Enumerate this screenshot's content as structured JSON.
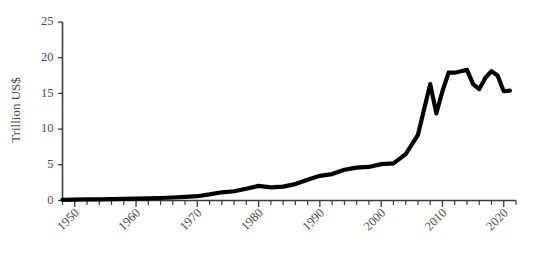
{
  "chart_data": {
    "type": "line",
    "title": "",
    "xlabel": "",
    "ylabel": "Trillion US$",
    "xlim": [
      1948,
      2022
    ],
    "ylim": [
      0,
      25
    ],
    "grid": false,
    "legend": null,
    "y_ticks": [
      0,
      5,
      10,
      15,
      20,
      25
    ],
    "y_tick_labels": [
      "0",
      "5",
      "10",
      "15",
      "20",
      "25"
    ],
    "x_ticks": [
      1950,
      1960,
      1970,
      1980,
      1990,
      2000,
      2010,
      2020
    ],
    "x_tick_labels": [
      "1950",
      "1960",
      "1970",
      "1980",
      "1990",
      "2000",
      "2010",
      "2020"
    ],
    "x_minor_tick_step": 2,
    "x_tick_label_rotation": 45,
    "series_color": "#000000",
    "axis_color": "#3b3b3b",
    "series": [
      {
        "name": "Value",
        "x": [
          1948,
          1950,
          1952,
          1954,
          1956,
          1958,
          1960,
          1962,
          1964,
          1966,
          1968,
          1970,
          1972,
          1974,
          1976,
          1978,
          1980,
          1982,
          1984,
          1986,
          1988,
          1990,
          1992,
          1994,
          1996,
          1998,
          2000,
          2002,
          2004,
          2006,
          2008,
          2009,
          2010,
          2011,
          2012,
          2013,
          2014,
          2015,
          2016,
          2017,
          2018,
          2019,
          2020,
          2021
        ],
        "values": [
          0.1,
          0.12,
          0.15,
          0.17,
          0.2,
          0.23,
          0.27,
          0.3,
          0.35,
          0.42,
          0.5,
          0.6,
          0.85,
          1.15,
          1.3,
          1.65,
          2.05,
          1.85,
          1.95,
          2.3,
          2.9,
          3.45,
          3.7,
          4.3,
          4.6,
          4.7,
          5.1,
          5.2,
          6.5,
          9.2,
          16.3,
          12.2,
          15.3,
          17.9,
          17.9,
          18.1,
          18.3,
          16.3,
          15.6,
          17.2,
          18.1,
          17.5,
          15.3,
          15.4
        ]
      }
    ]
  },
  "axis": {
    "y_title": "Trillion US$"
  }
}
